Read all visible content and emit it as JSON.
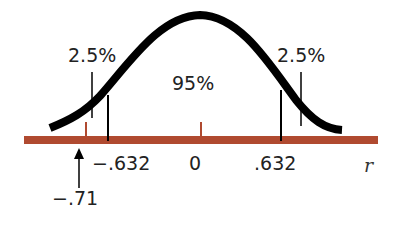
{
  "figure": {
    "title": "",
    "axis_variable": "r",
    "colors": {
      "curve": "#000000",
      "axis_bar": "#b04a30",
      "marker_tick": "#b04a30",
      "critical_lines": "#000000",
      "text": "#222222"
    },
    "labels": {
      "left_tail": "2.5%",
      "center": "95%",
      "right_tail": "2.5%",
      "left_critical": "−.632",
      "zero": "0",
      "right_critical": ".632",
      "axis": "r",
      "observed": "−.71"
    },
    "values": {
      "left_critical_value": -0.632,
      "right_critical_value": 0.632,
      "observed_value": -0.71,
      "center_value": 0,
      "left_tail_percent": 2.5,
      "center_percent": 95,
      "right_tail_percent": 2.5
    }
  }
}
